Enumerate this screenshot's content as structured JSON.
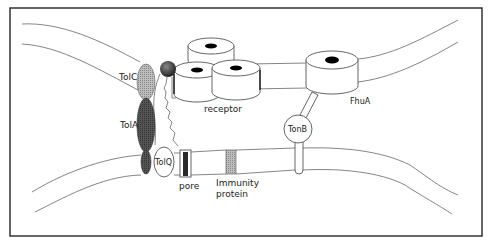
{
  "figure": {
    "type": "schematic"
  },
  "labels": {
    "tolc": "TolC",
    "tola": "TolA",
    "tolq": "TolQ",
    "receptor": "receptor",
    "fhua": "FhuA",
    "tonb": "TonB",
    "pore": "pore",
    "immunity_line1": "Immunity",
    "immunity_line2": "protein"
  },
  "colors": {
    "frame": "#333333",
    "membrane_line": "#777777",
    "tolc_fill": "#a8a8a8",
    "tola_fill": "#555555",
    "sphere_fill": "#4a4a4a",
    "pore_core": "#2a2a2a",
    "immunity_fill": "#8c8c8c",
    "hole_fill": "#000000"
  }
}
